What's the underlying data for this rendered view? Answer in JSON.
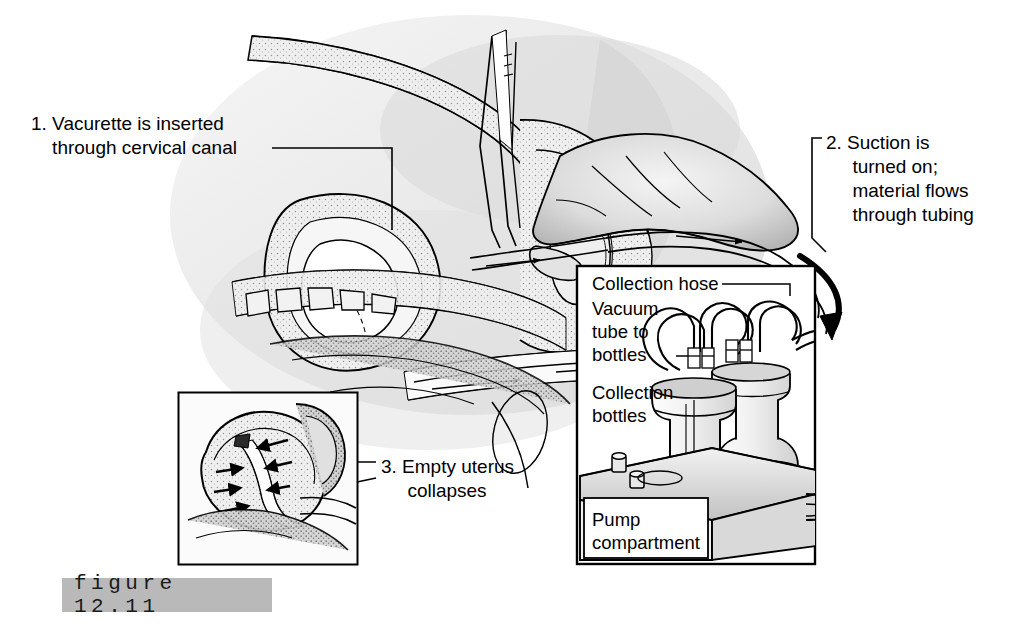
{
  "figure": {
    "caption": "figure  12.11",
    "caption_band_color": "#b9b9b9"
  },
  "callouts": [
    {
      "id": "callout-1",
      "number": "1.",
      "text": "1. Vacurette is inserted\n    through cervical canal"
    },
    {
      "id": "callout-2",
      "number": "2.",
      "text": "2. Suction is\n     turned on;\n     material flows\n     through tubing"
    },
    {
      "id": "callout-3",
      "number": "3.",
      "text": "3. Empty uterus\n     collapses"
    }
  ],
  "machine_inset": {
    "labels": {
      "collection_hose": "Collection hose",
      "vacuum_tube": "Vacuum\ntube to\nbottles",
      "collection_bottles": "Collection\nbottles",
      "pump_compartment": "Pump\ncompartment"
    }
  },
  "colors": {
    "ink": "#000000",
    "background": "#ffffff",
    "tone_light": "#e9e9e9",
    "tone_mid": "#c9c9c9",
    "tone_dark": "#9a9a9a"
  }
}
